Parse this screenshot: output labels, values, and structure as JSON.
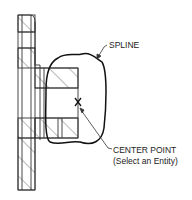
{
  "diagram": {
    "type": "cad-section-view",
    "labels": {
      "spline": "SPLINE",
      "center_point_line1": "CENTER POINT",
      "center_point_line2": "(Select an Entity)"
    },
    "marker": {
      "symbol": "X",
      "meaning": "center point"
    },
    "colors": {
      "stroke": "#333333",
      "hatch": "#555555",
      "spline": "#111111",
      "text": "#222222"
    }
  }
}
